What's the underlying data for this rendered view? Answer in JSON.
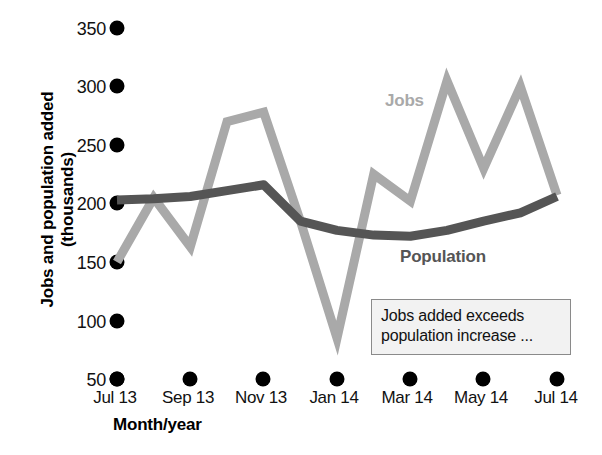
{
  "chart_data": {
    "type": "line",
    "title": "",
    "xlabel": "Month/year",
    "ylabel": "Jobs and population added (thousands)",
    "ylim": [
      50,
      350
    ],
    "yticks": [
      50,
      100,
      150,
      200,
      250,
      300,
      350
    ],
    "grid": false,
    "legend_position": "inline-labels",
    "x": [
      "Jul 13",
      "Aug 13",
      "Sep 13",
      "Oct 13",
      "Nov 13",
      "Dec 13",
      "Jan 14",
      "Feb 14",
      "Mar 14",
      "Apr 14",
      "May 14",
      "Jun 14",
      "Jul 14"
    ],
    "xtick_labels": [
      "Jul 13",
      "Sep 13",
      "Nov 13",
      "Jan 14",
      "Mar 14",
      "May 14",
      "Jul 14"
    ],
    "series": [
      {
        "name": "Jobs",
        "color": "#a9a9a9",
        "values": [
          150,
          205,
          163,
          270,
          278,
          185,
          85,
          225,
          202,
          305,
          230,
          300,
          207
        ]
      },
      {
        "name": "Population",
        "color": "#555555",
        "values": [
          203,
          204,
          206,
          211,
          216,
          185,
          177,
          173,
          172,
          177,
          185,
          192,
          206
        ]
      }
    ],
    "annotations": [
      {
        "text_line_1": "Jobs added exceeds",
        "text_line_2": "population increase ..."
      }
    ]
  },
  "labels": {
    "jobs": "Jobs",
    "population": "Population",
    "y_axis_line_1": "Jobs and population added",
    "y_axis_line_2": "(thousands)",
    "x_axis": "Month/year"
  },
  "yticks": {
    "t350": "350",
    "t300": "300",
    "t250": "250",
    "t200": "200",
    "t150": "150",
    "t100": "100",
    "t50": "50"
  },
  "xticks": {
    "t1": "Jul 13",
    "t2": "Sep 13",
    "t3": "Nov 13",
    "t4": "Jan 14",
    "t5": "Mar 14",
    "t6": "May 14",
    "t7": "Jul 14"
  },
  "annotation": {
    "line1": "Jobs added exceeds",
    "line2": "population increase ..."
  },
  "colors": {
    "jobs_line": "#a9a9a9",
    "population_line": "#555555",
    "tick_dot": "#000000",
    "annotation_border": "#8a8a8a",
    "annotation_background": "#f2f2f2"
  }
}
